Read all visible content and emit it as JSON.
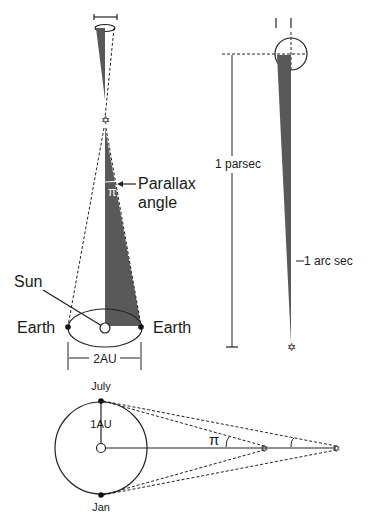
{
  "figure": {
    "left_diagram": {
      "labels": {
        "parallax_line1": "Parallax",
        "parallax_line2": "angle",
        "pi": "π",
        "sun": "Sun",
        "earth_left": "Earth",
        "earth_right": "Earth",
        "baseline": "2AU"
      }
    },
    "right_diagram": {
      "labels": {
        "distance": "1 parsec",
        "angle": "1 arc sec"
      }
    },
    "bottom_diagram": {
      "labels": {
        "july": "July",
        "jan": "Jan",
        "radius": "1AU",
        "pi": "π"
      }
    },
    "colors": {
      "wedge": "#595959",
      "line": "#222222",
      "background": "#ffffff"
    }
  }
}
